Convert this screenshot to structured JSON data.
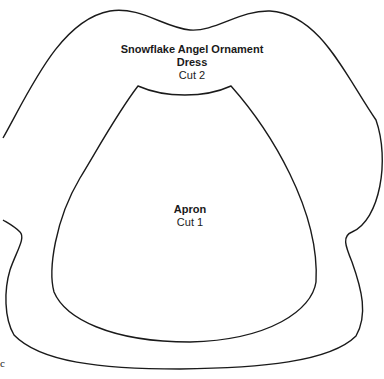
{
  "pattern": {
    "title": "Snowflake Angel Ornament",
    "dress": {
      "name": "Dress",
      "cut": "Cut 2"
    },
    "apron": {
      "name": "Apron",
      "cut": "Cut 1"
    },
    "corner_mark": "c",
    "outline_color": "#1a1a1a"
  }
}
